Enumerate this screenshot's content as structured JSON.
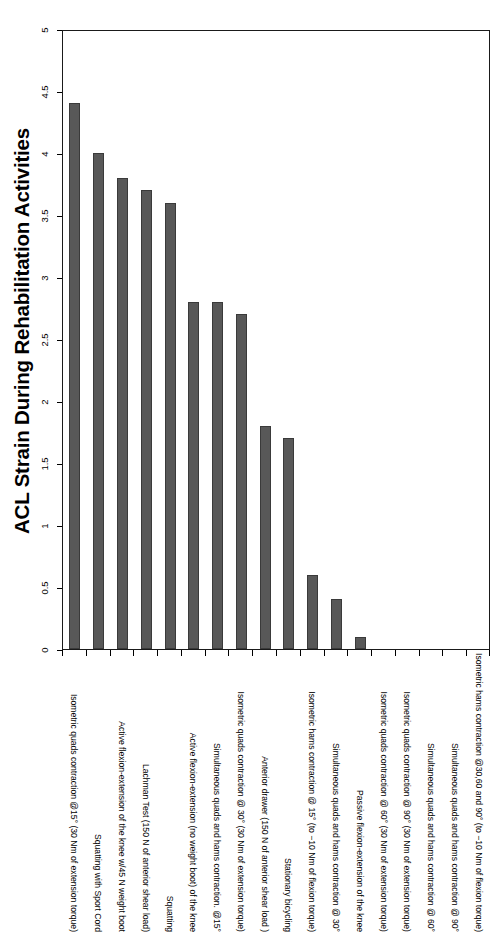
{
  "chart_data": {
    "type": "bar",
    "title": "ACL Strain During Rehabilitation Activities",
    "xlabel": "",
    "ylabel": "",
    "ylim": [
      0,
      5
    ],
    "yticks": [
      "0",
      "0.5",
      "1",
      "1.5",
      "2",
      "2.5",
      "3",
      "3.5",
      "4",
      "4.5",
      "5"
    ],
    "ytick_values": [
      0,
      0.5,
      1,
      1.5,
      2,
      2.5,
      3,
      3.5,
      4,
      4.5,
      5
    ],
    "grid": false,
    "legend": "none",
    "orientation": "vertical",
    "bar_color": "#585858",
    "bar_edge_color": "#3a3a3a",
    "axis_color": "#1a1a1a",
    "categories": [
      "Isometric quads contraction @15° (30 Nm of extension torque)",
      "Squatting with Sport Cord",
      "Active flexion-extension of the knee w/45 N weight boot",
      "Lachman Test (150 N of anterior shear load)",
      "Squatting",
      "Active flexion-extension (no weight boot) of the knee",
      "Simultaneous quads and hams contraction. @15°",
      "Isometric quads contraction @ 30° (30 Nm of extension torque)",
      "Anterior drawer (150 N of anterior shear load )",
      "Stationary bicycling",
      "Isometric hams contraction @ 15° (to −10 Nm of flexion torque)",
      "Simultaneous quads and hams contraction @ 30°",
      "Passive flexion-extension of the knee",
      "Isometric quads contraction @ 60° (30 Nm of extension torque)",
      "Isometric quads contraction @ 90° (30 Nm of extension torque)",
      "Simultaneous quads and hams contraction @ 60°",
      "Simultaneous quads and hams contraction @ 90°",
      "Isometric hams contraction @30,60 and 90° (to −10 Nm of flexion torque)"
    ],
    "values": [
      4.4,
      4.0,
      3.8,
      3.7,
      3.6,
      2.8,
      2.8,
      2.7,
      1.8,
      1.7,
      0.6,
      0.4,
      0.1,
      0,
      0,
      0,
      0,
      0
    ]
  }
}
